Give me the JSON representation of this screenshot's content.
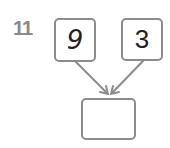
{
  "question": {
    "number": "11"
  },
  "diagram": {
    "inputs": [
      {
        "value": "9"
      },
      {
        "value": "3"
      }
    ],
    "output": {
      "value": ""
    },
    "colors": {
      "border": "#8c8c8c",
      "number_label": "#8a8a8a",
      "text": "#222222"
    }
  }
}
